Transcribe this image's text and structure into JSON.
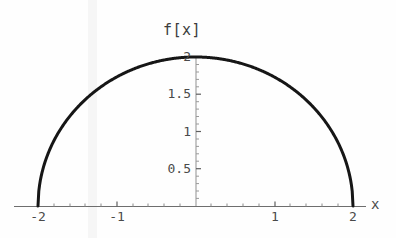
{
  "chart_data": {
    "type": "line",
    "title": "f[x]",
    "xlabel": "x",
    "ylabel": "",
    "xlim": [
      -2.35,
      2.35
    ],
    "ylim": [
      0,
      2.12
    ],
    "grid": false,
    "legend": null,
    "function": "f[x] = Sqrt[4 - x^2]",
    "xticks": [
      {
        "value": -2,
        "label": "-2"
      },
      {
        "value": -1,
        "label": "-1"
      },
      {
        "value": 0,
        "label": ""
      },
      {
        "value": 1,
        "label": "1"
      },
      {
        "value": 2,
        "label": "2"
      }
    ],
    "yticks": [
      {
        "value": 0.5,
        "label": "0.5"
      },
      {
        "value": 1,
        "label": "1"
      },
      {
        "value": 1.5,
        "label": "1.5"
      },
      {
        "value": 2,
        "label": "2"
      }
    ],
    "minor_tick_step": 0.2,
    "series": [
      {
        "name": "f[x]",
        "color": "#161616",
        "x": [
          -2,
          -1.9,
          -1.8,
          -1.7,
          -1.6,
          -1.5,
          -1.4,
          -1.3,
          -1.2,
          -1.1,
          -1,
          -0.9,
          -0.8,
          -0.7,
          -0.6,
          -0.5,
          -0.4,
          -0.3,
          -0.2,
          -0.1,
          0,
          0.1,
          0.2,
          0.3,
          0.4,
          0.5,
          0.6,
          0.7,
          0.8,
          0.9,
          1,
          1.1,
          1.2,
          1.3,
          1.4,
          1.5,
          1.6,
          1.7,
          1.8,
          1.9,
          2
        ],
        "y": [
          0,
          0.62,
          0.87,
          1.05,
          1.2,
          1.32,
          1.43,
          1.51,
          1.6,
          1.67,
          1.73,
          1.79,
          1.83,
          1.87,
          1.91,
          1.94,
          1.96,
          1.98,
          1.99,
          2,
          2,
          2,
          1.99,
          1.98,
          1.96,
          1.94,
          1.91,
          1.87,
          1.83,
          1.79,
          1.73,
          1.67,
          1.6,
          1.51,
          1.43,
          1.32,
          1.2,
          1.05,
          0.87,
          0.62,
          0
        ]
      }
    ]
  },
  "axes": {
    "x_axis_label": "x",
    "y_axis_line_color": "#8f8f8f",
    "x_axis_line_color": "#6e6e6e"
  }
}
